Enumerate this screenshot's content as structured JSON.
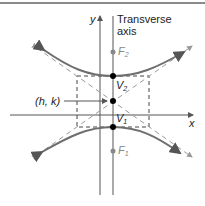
{
  "labels": {
    "y_axis": "y",
    "x_axis": "x",
    "transverse_line1": "Transverse",
    "transverse_line2": "axis",
    "center": "(h, k)",
    "v2_base": "V",
    "v2_sub": "2",
    "v1_base": "V",
    "v1_sub": "1",
    "f2_base": "F",
    "f2_sub": "2",
    "f1_base": "F",
    "f1_sub": "1"
  },
  "colors": {
    "axis": "#555555",
    "curve": "#6e6e6e",
    "asymptote": "#999999",
    "box": "#444444",
    "point": "#000000",
    "focus": "#888888"
  }
}
